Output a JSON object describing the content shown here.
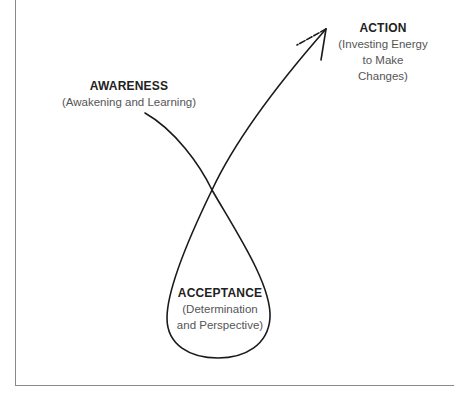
{
  "diagram": {
    "type": "process-loop",
    "stages": [
      {
        "id": "awareness",
        "title": "AWARENESS",
        "subtitle": "(Awakening and Learning)"
      },
      {
        "id": "acceptance",
        "title": "ACCEPTANCE",
        "subtitle_line1": "(Determination",
        "subtitle_line2": "and Perspective)"
      },
      {
        "id": "action",
        "title": "ACTION",
        "subtitle_line1": "(Investing Energy",
        "subtitle_line2": "to Make",
        "subtitle_line3": "Changes)"
      }
    ],
    "flow": [
      "AWARENESS",
      "ACCEPTANCE",
      "ACTION"
    ],
    "colors": {
      "line": "#1a1a1a",
      "frame": "#8a8a8a",
      "background": "#ffffff"
    }
  }
}
